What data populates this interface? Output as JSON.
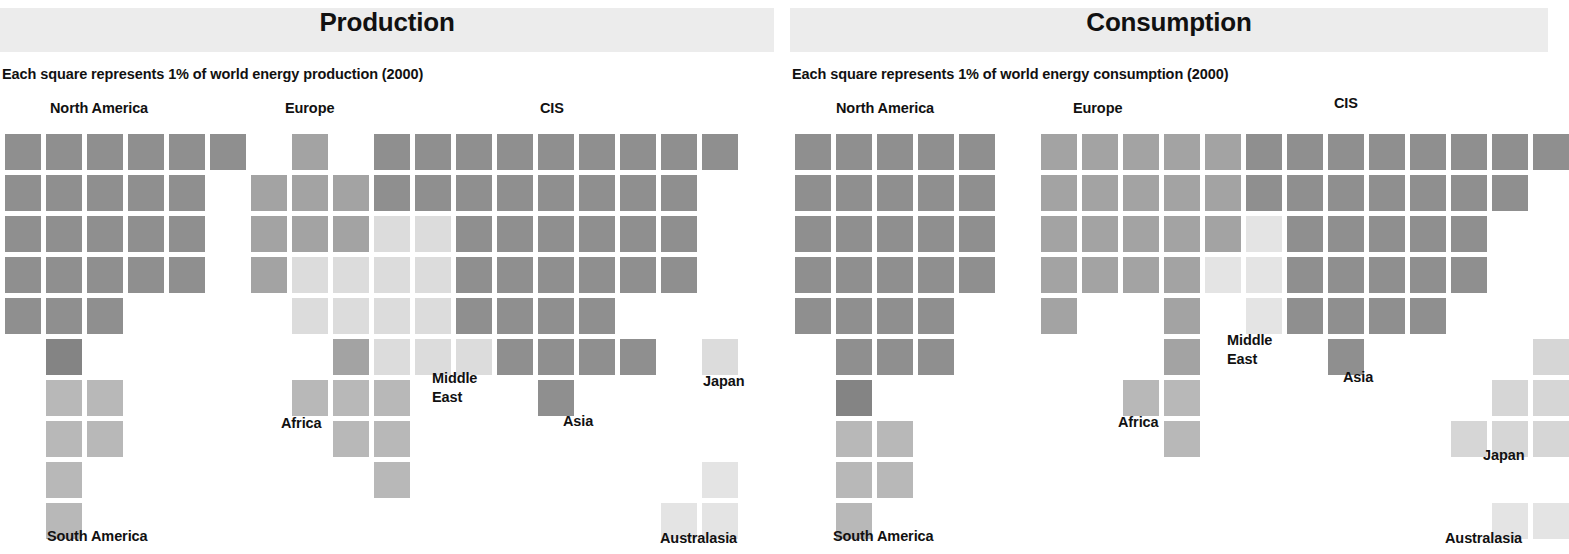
{
  "geometry": {
    "cell": 36,
    "step_x": 41,
    "step_y": 41,
    "origin_x": 5,
    "origin_y": 134
  },
  "palette": {
    "dark": "#8f8f8f",
    "darker": "#848484",
    "mid": "#a3a3a3",
    "light": "#b8b8b8",
    "lighter": "#d6d6d6",
    "pale": "#e4e4e4",
    "band": "#ececec",
    "text": "#111111"
  },
  "chart_data": {
    "type": "heatmap",
    "unit": "1% of world energy",
    "year": "2000",
    "grid": {
      "cols": 19,
      "rows": 11,
      "cell_px": 36
    },
    "panels": [
      {
        "id": "production",
        "title": "Production",
        "subtitle": "Each square represents 1% of world energy production (2000)",
        "origin_x": 5,
        "regions": [
          {
            "name": "North America",
            "label_x": 50,
            "label_y": 112,
            "share_percent": 19,
            "color": "#8f8f8f",
            "cells": [
              [
                0,
                0
              ],
              [
                1,
                0
              ],
              [
                2,
                0
              ],
              [
                3,
                0
              ],
              [
                4,
                0
              ],
              [
                5,
                0
              ],
              [
                0,
                1
              ],
              [
                1,
                1
              ],
              [
                2,
                1
              ],
              [
                3,
                1
              ],
              [
                4,
                1
              ],
              [
                0,
                2
              ],
              [
                1,
                2
              ],
              [
                2,
                2
              ],
              [
                3,
                2
              ],
              [
                4,
                2
              ],
              [
                0,
                3
              ],
              [
                1,
                3
              ],
              [
                2,
                3
              ],
              [
                3,
                3
              ],
              [
                4,
                3
              ],
              [
                0,
                4
              ],
              [
                1,
                4
              ],
              [
                2,
                4
              ]
            ]
          },
          {
            "name": "South America",
            "label_x": 47,
            "label_y": 540,
            "share_percent": 8,
            "color": "#b8b8b8",
            "dark_cells": [
              [
                1,
                5
              ]
            ],
            "cells": [
              [
                1,
                6
              ],
              [
                2,
                6
              ],
              [
                1,
                7
              ],
              [
                2,
                7
              ],
              [
                1,
                8
              ],
              [
                1,
                9
              ]
            ]
          },
          {
            "name": "Europe",
            "label_x": 285,
            "label_y": 112,
            "share_percent": 11,
            "color": "#a3a3a3",
            "cells": [
              [
                7,
                0
              ],
              [
                6,
                1
              ],
              [
                7,
                1
              ],
              [
                8,
                1
              ],
              [
                6,
                2
              ],
              [
                7,
                2
              ],
              [
                8,
                2
              ],
              [
                6,
                3
              ],
              [
                8,
                5
              ]
            ]
          },
          {
            "name": "Africa",
            "label_x": 281,
            "label_y": 427,
            "share_percent": 7,
            "color": "#b8b8b8",
            "cells": [
              [
                7,
                6
              ],
              [
                8,
                6
              ],
              [
                9,
                6
              ],
              [
                8,
                7
              ],
              [
                9,
                7
              ],
              [
                9,
                8
              ]
            ]
          },
          {
            "name": "Middle East",
            "label_x": 432,
            "label_y": 382,
            "share_percent": 11,
            "color": "#dcdcdc",
            "cells": [
              [
                9,
                2
              ],
              [
                10,
                2
              ],
              [
                7,
                3
              ],
              [
                8,
                3
              ],
              [
                9,
                3
              ],
              [
                10,
                3
              ],
              [
                7,
                4
              ],
              [
                8,
                4
              ],
              [
                9,
                4
              ],
              [
                10,
                4
              ],
              [
                9,
                5
              ],
              [
                10,
                5
              ],
              [
                11,
                5
              ]
            ]
          },
          {
            "name": "CIS",
            "label_x": 540,
            "label_y": 112,
            "share_percent": 14,
            "color": "#8f8f8f",
            "cells": [
              [
                9,
                0
              ],
              [
                10,
                0
              ],
              [
                11,
                0
              ],
              [
                12,
                0
              ],
              [
                13,
                0
              ],
              [
                14,
                0
              ],
              [
                15,
                0
              ],
              [
                16,
                0
              ],
              [
                17,
                0
              ],
              [
                9,
                1
              ],
              [
                10,
                1
              ],
              [
                11,
                1
              ],
              [
                12,
                1
              ],
              [
                13,
                1
              ],
              [
                14,
                1
              ],
              [
                15,
                1
              ],
              [
                16,
                1
              ],
              [
                11,
                2
              ],
              [
                12,
                2
              ],
              [
                13,
                2
              ],
              [
                14,
                2
              ],
              [
                15,
                2
              ],
              [
                16,
                2
              ],
              [
                11,
                3
              ],
              [
                12,
                3
              ],
              [
                13,
                3
              ],
              [
                14,
                3
              ],
              [
                15,
                3
              ],
              [
                16,
                3
              ]
            ]
          },
          {
            "name": "Asia",
            "label_x": 563,
            "label_y": 425,
            "share_percent": 10,
            "color": "#8f8f8f",
            "cells": [
              [
                11,
                4
              ],
              [
                12,
                4
              ],
              [
                13,
                4
              ],
              [
                14,
                4
              ],
              [
                12,
                5
              ],
              [
                13,
                5
              ],
              [
                14,
                5
              ],
              [
                15,
                5
              ],
              [
                13,
                6
              ]
            ]
          },
          {
            "name": "Japan",
            "label_x": 703,
            "label_y": 385,
            "share_percent": 1,
            "color": "#dcdcdc",
            "cells": [
              [
                17,
                5
              ]
            ]
          },
          {
            "name": "Australasia",
            "label_x": 660,
            "label_y": 542,
            "share_percent": 3,
            "color": "#e4e4e4",
            "cells": [
              [
                17,
                8
              ],
              [
                16,
                9
              ],
              [
                17,
                9
              ]
            ]
          }
        ]
      },
      {
        "id": "consumption",
        "title": "Consumption",
        "subtitle": "Each square represents 1% of world energy consumption (2000)",
        "origin_x": 5,
        "regions": [
          {
            "name": "North America",
            "label_x": 46,
            "label_y": 112,
            "share_percent": 27,
            "color": "#8f8f8f",
            "cells": [
              [
                0,
                0
              ],
              [
                1,
                0
              ],
              [
                2,
                0
              ],
              [
                3,
                0
              ],
              [
                4,
                0
              ],
              [
                0,
                1
              ],
              [
                1,
                1
              ],
              [
                2,
                1
              ],
              [
                3,
                1
              ],
              [
                4,
                1
              ],
              [
                0,
                2
              ],
              [
                1,
                2
              ],
              [
                2,
                2
              ],
              [
                3,
                2
              ],
              [
                4,
                2
              ],
              [
                0,
                3
              ],
              [
                1,
                3
              ],
              [
                2,
                3
              ],
              [
                3,
                3
              ],
              [
                4,
                3
              ],
              [
                0,
                4
              ],
              [
                1,
                4
              ],
              [
                2,
                4
              ],
              [
                3,
                4
              ],
              [
                1,
                5
              ],
              [
                2,
                5
              ],
              [
                3,
                5
              ]
            ]
          },
          {
            "name": "South America",
            "label_x": 43,
            "label_y": 540,
            "share_percent": 6,
            "color": "#b8b8b8",
            "dark_cells": [
              [
                1,
                6
              ]
            ],
            "cells": [
              [
                1,
                7
              ],
              [
                2,
                7
              ],
              [
                1,
                8
              ],
              [
                2,
                8
              ],
              [
                1,
                9
              ]
            ]
          },
          {
            "name": "Europe",
            "label_x": 283,
            "label_y": 112,
            "share_percent": 21,
            "color": "#a3a3a3",
            "cells": [
              [
                6,
                0
              ],
              [
                7,
                0
              ],
              [
                8,
                0
              ],
              [
                9,
                0
              ],
              [
                10,
                0
              ],
              [
                6,
                1
              ],
              [
                7,
                1
              ],
              [
                8,
                1
              ],
              [
                9,
                1
              ],
              [
                10,
                1
              ],
              [
                6,
                2
              ],
              [
                7,
                2
              ],
              [
                8,
                2
              ],
              [
                9,
                2
              ],
              [
                10,
                2
              ],
              [
                6,
                3
              ],
              [
                7,
                3
              ],
              [
                8,
                3
              ],
              [
                9,
                3
              ],
              [
                6,
                4
              ]
            ]
          },
          {
            "name": "Africa",
            "label_x": 1118,
            "label_y": 426,
            "label_abs": true,
            "share_percent": 4,
            "color": "#b8b8b8",
            "cells": [
              [
                8,
                6
              ],
              [
                9,
                6
              ],
              [
                9,
                7
              ]
            ]
          },
          {
            "name": "Middle East",
            "label_x": 1227,
            "label_y": 344,
            "label_abs": true,
            "share_percent": 4,
            "color": "#a3a3a3",
            "cells": [
              [
                9,
                4
              ],
              [
                9,
                5
              ]
            ]
          },
          {
            "name": "CIS",
            "label_x": 1334,
            "label_y": 107,
            "label_abs": true,
            "share_percent": 10,
            "color": "#8f8f8f",
            "pale_cells": [
              [
                11,
                2
              ],
              [
                10,
                3
              ],
              [
                11,
                3
              ],
              [
                11,
                4
              ]
            ],
            "cells": [
              [
                11,
                0
              ],
              [
                12,
                0
              ],
              [
                13,
                0
              ],
              [
                14,
                0
              ],
              [
                15,
                0
              ],
              [
                16,
                0
              ],
              [
                17,
                0
              ],
              [
                18,
                0
              ],
              [
                11,
                1
              ],
              [
                12,
                1
              ],
              [
                13,
                1
              ],
              [
                14,
                1
              ],
              [
                15,
                1
              ],
              [
                16,
                1
              ],
              [
                17,
                1
              ],
              [
                12,
                2
              ],
              [
                13,
                2
              ],
              [
                14,
                2
              ],
              [
                15,
                2
              ],
              [
                16,
                2
              ],
              [
                12,
                3
              ],
              [
                13,
                3
              ],
              [
                14,
                3
              ],
              [
                15,
                3
              ],
              [
                16,
                3
              ]
            ]
          },
          {
            "name": "Asia",
            "label_x": 1343,
            "label_y": 381,
            "label_abs": true,
            "share_percent": 20,
            "color": "#8f8f8f",
            "cells": [
              [
                12,
                4
              ],
              [
                13,
                4
              ],
              [
                14,
                4
              ],
              [
                15,
                4
              ],
              [
                13,
                5
              ]
            ]
          },
          {
            "name": "Japan",
            "label_x": 1483,
            "label_y": 459,
            "label_abs": true,
            "share_percent": 5,
            "color": "#d6d6d6",
            "cells": [
              [
                18,
                5
              ],
              [
                17,
                6
              ],
              [
                18,
                6
              ],
              [
                16,
                7
              ],
              [
                17,
                7
              ],
              [
                18,
                7
              ]
            ]
          },
          {
            "name": "Australasia",
            "label_x": 1445,
            "label_y": 542,
            "label_abs": true,
            "share_percent": 2,
            "color": "#e4e4e4",
            "cells": [
              [
                17,
                9
              ],
              [
                18,
                9
              ]
            ]
          }
        ]
      }
    ]
  }
}
